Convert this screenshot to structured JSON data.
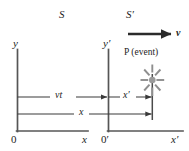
{
  "figure": {
    "background_color": "#ffffff",
    "line_color": "#3a3a3a",
    "axis_color": "#555555",
    "text_color": "#1d1d1d",
    "event_color": "#8c8c8c",
    "width": 189,
    "height": 151
  },
  "frames": {
    "rest": {
      "label": "S",
      "x_axis_label": "x",
      "y_axis_label": "y",
      "origin_label": "0"
    },
    "moving": {
      "label": "S′",
      "x_axis_label": "x′",
      "y_axis_label": "y′",
      "origin_label": "0′"
    }
  },
  "velocity": {
    "label": "v",
    "arrow_name": "velocity-arrow"
  },
  "event": {
    "point_label": "P",
    "description": "(event)",
    "full_label": "P (event)",
    "marker": "starburst"
  },
  "measurements": [
    {
      "key": "vt",
      "label": "vt",
      "from": "S origin",
      "to": "S′ origin"
    },
    {
      "key": "xprime",
      "label": "x′",
      "from": "S′ origin",
      "to": "event"
    },
    {
      "key": "x",
      "label": "x",
      "from": "S origin",
      "to": "event"
    }
  ]
}
